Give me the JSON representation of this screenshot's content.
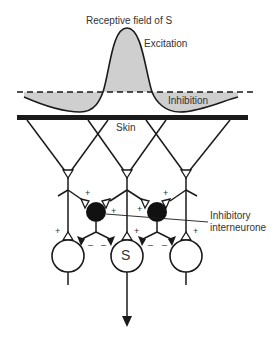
{
  "diagram": {
    "title": "Receptive field of S",
    "labels": {
      "excitation": "Excitation",
      "inhibition": "Inhibition",
      "skin": "Skin",
      "interneuron_line1": "Inhibitory",
      "interneuron_line2": "interneurone",
      "center_neuron": "S"
    },
    "signs": {
      "plus": "+",
      "minus": "–"
    },
    "colors": {
      "stroke": "#1a1a1a",
      "fill_field": "#cfcfcf",
      "interneuron": "#111111",
      "text": "#333333"
    }
  }
}
